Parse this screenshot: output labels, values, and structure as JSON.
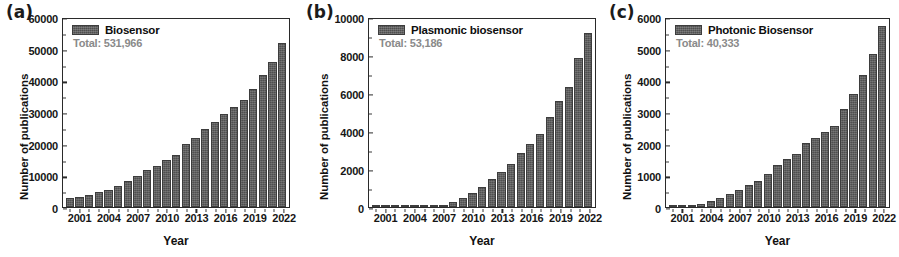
{
  "figure": {
    "background": "#ffffff",
    "bar_color": "#5b5b5b",
    "axis_color": "#2a2a2a",
    "total_text_color": "#8a8a8a"
  },
  "panels": [
    {
      "tag": "(a)",
      "legend_label": "Biosensor",
      "total_label": "Total: 531,966",
      "xlabel": "Year",
      "ylabel": "Number of publications"
    },
    {
      "tag": "(b)",
      "legend_label": "Plasmonic biosensor",
      "total_label": "Total: 53,186",
      "xlabel": "Year",
      "ylabel": "Number of publications"
    },
    {
      "tag": "(c)",
      "legend_label": "Photonic Biosensor",
      "total_label": "Total: 40,333",
      "xlabel": "Year",
      "ylabel": "Number of publications"
    }
  ],
  "chart_data": [
    {
      "type": "bar",
      "title": "(a) Biosensor",
      "series_name": "Biosensor",
      "annotation": "Total: 531,966",
      "xlabel": "Year",
      "ylabel": "Number of publications",
      "ylim": [
        0,
        60000
      ],
      "yticks": [
        0,
        10000,
        20000,
        30000,
        40000,
        50000,
        60000
      ],
      "ytick_labels": [
        "0",
        "10000",
        "20000",
        "30000",
        "40000",
        "50000",
        "60000"
      ],
      "xtick_labels": [
        "2001",
        "2004",
        "2007",
        "2010",
        "2013",
        "2016",
        "2019",
        "2022"
      ],
      "grid": false,
      "legend_position": "top-left",
      "categories": [
        2000,
        2001,
        2002,
        2003,
        2004,
        2005,
        2006,
        2007,
        2008,
        2009,
        2010,
        2011,
        2012,
        2013,
        2014,
        2015,
        2016,
        2017,
        2018,
        2019,
        2020,
        2021,
        2022
      ],
      "values": [
        3000,
        3300,
        3800,
        4700,
        5400,
        6800,
        8300,
        9900,
        11700,
        13000,
        15100,
        16600,
        20000,
        22000,
        24900,
        27000,
        29700,
        32000,
        34200,
        37700,
        42000,
        46300,
        52200
      ]
    },
    {
      "type": "bar",
      "title": "(b) Plasmonic biosensor",
      "series_name": "Plasmonic biosensor",
      "annotation": "Total: 53,186",
      "xlabel": "Year",
      "ylabel": "Number of publications",
      "ylim": [
        0,
        10000
      ],
      "yticks": [
        0,
        2000,
        4000,
        6000,
        8000,
        10000
      ],
      "ytick_labels": [
        "0",
        "2000",
        "4000",
        "6000",
        "8000",
        "10000"
      ],
      "xtick_labels": [
        "2001",
        "2004",
        "2007",
        "2010",
        "2013",
        "2016",
        "2019",
        "2022"
      ],
      "grid": false,
      "legend_position": "top-left",
      "categories": [
        2000,
        2001,
        2002,
        2003,
        2004,
        2005,
        2006,
        2007,
        2008,
        2009,
        2010,
        2011,
        2012,
        2013,
        2014,
        2015,
        2016,
        2017,
        2018,
        2019,
        2020,
        2021,
        2022
      ],
      "values": [
        5,
        8,
        12,
        18,
        25,
        40,
        70,
        120,
        270,
        490,
        760,
        1080,
        1500,
        1840,
        2300,
        2850,
        3350,
        3880,
        4780,
        5630,
        6380,
        7950,
        9280
      ]
    },
    {
      "type": "bar",
      "title": "(c) Photonic Biosensor",
      "series_name": "Photonic Biosensor",
      "annotation": "Total: 40,333",
      "xlabel": "Year",
      "ylabel": "Number of publications",
      "ylim": [
        0,
        6000
      ],
      "yticks": [
        0,
        1000,
        2000,
        3000,
        4000,
        5000,
        6000
      ],
      "ytick_labels": [
        "0",
        "1000",
        "2000",
        "3000",
        "4000",
        "5000",
        "6000"
      ],
      "xtick_labels": [
        "2001",
        "2004",
        "2007",
        "2010",
        "2013",
        "2016",
        "2019",
        "2022"
      ],
      "grid": false,
      "legend_position": "top-left",
      "categories": [
        2000,
        2001,
        2002,
        2003,
        2004,
        2005,
        2006,
        2007,
        2008,
        2009,
        2010,
        2011,
        2012,
        2013,
        2014,
        2015,
        2016,
        2017,
        2018,
        2019,
        2020,
        2021,
        2022
      ],
      "values": [
        15,
        25,
        45,
        110,
        200,
        280,
        430,
        550,
        700,
        820,
        1060,
        1340,
        1540,
        1700,
        2050,
        2190,
        2410,
        2580,
        3120,
        3620,
        4220,
        4890,
        5790
      ]
    }
  ]
}
